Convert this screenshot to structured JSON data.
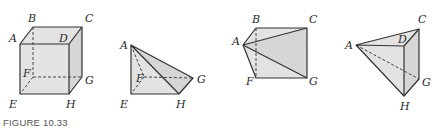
{
  "caption": "FIGURE 10.33",
  "colors": {
    "stroke": "#333333",
    "face_fill": "#e3e3e3",
    "face_fill_dark": "#d6d6d6",
    "label": "#2a2a2a"
  },
  "figures": [
    {
      "name": "cube",
      "vertices": [
        "A",
        "B",
        "C",
        "D",
        "E",
        "F",
        "G",
        "H"
      ],
      "labels": {
        "A": "A",
        "B": "B",
        "C": "C",
        "D": "D",
        "E": "E",
        "F": "F",
        "G": "G",
        "H": "H"
      }
    },
    {
      "name": "pyramid-AEFGH",
      "vertices": [
        "A",
        "E",
        "F",
        "G",
        "H"
      ],
      "labels": {
        "A": "A",
        "E": "E",
        "F": "F",
        "G": "G",
        "H": "H"
      }
    },
    {
      "name": "pyramid-ABCFG",
      "vertices": [
        "A",
        "B",
        "C",
        "F",
        "G"
      ],
      "labels": {
        "A": "A",
        "B": "B",
        "C": "C",
        "F": "F",
        "G": "G"
      }
    },
    {
      "name": "pyramid-ACDGH",
      "vertices": [
        "A",
        "C",
        "D",
        "G",
        "H"
      ],
      "labels": {
        "A": "A",
        "C": "C",
        "D": "D",
        "G": "G",
        "H": "H"
      }
    }
  ]
}
